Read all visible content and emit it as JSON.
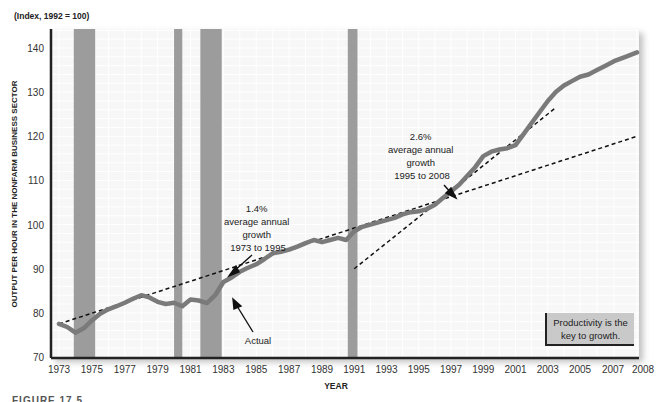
{
  "chart_data": {
    "type": "line",
    "title": "",
    "units_note": "(Index, 1992 = 100)",
    "xlabel": "YEAR",
    "ylabel": "OUTPUT PER HOUR IN THE NONFARM BUSINESS SECTOR",
    "ylim": [
      70,
      145
    ],
    "xlim": [
      1973,
      2008
    ],
    "y_ticks": [
      70,
      80,
      90,
      100,
      110,
      120,
      130,
      140
    ],
    "x_ticks": [
      "1973",
      "1975",
      "1977",
      "1979",
      "1981",
      "1983",
      "1985",
      "1987",
      "1989",
      "1991",
      "1993",
      "1995",
      "1997",
      "1999",
      "2001",
      "2003",
      "2005",
      "2007",
      "2008"
    ],
    "grid": true,
    "recession_shading": [
      [
        1973.9,
        1975.2
      ],
      [
        1980.0,
        1980.5
      ],
      [
        1981.6,
        1982.9
      ],
      [
        1990.6,
        1991.2
      ]
    ],
    "series": [
      {
        "name": "Actual",
        "style": "solid-thick-gray",
        "x": [
          1973,
          1973.5,
          1974,
          1974.5,
          1975,
          1975.5,
          1976,
          1976.5,
          1977,
          1977.5,
          1978,
          1978.5,
          1979,
          1979.5,
          1980,
          1980.5,
          1981,
          1981.5,
          1982,
          1982.5,
          1983,
          1983.5,
          1984,
          1984.5,
          1985,
          1985.5,
          1986,
          1986.5,
          1987,
          1987.5,
          1988,
          1988.5,
          1989,
          1989.5,
          1990,
          1990.5,
          1991,
          1991.5,
          1992,
          1992.5,
          1993,
          1993.5,
          1994,
          1994.5,
          1995,
          1995.5,
          1996,
          1996.5,
          1997,
          1997.5,
          1998,
          1998.5,
          1999,
          1999.5,
          2000,
          2000.5,
          2001,
          2001.5,
          2002,
          2002.5,
          2003,
          2003.5,
          2004,
          2004.5,
          2005,
          2005.5,
          2006,
          2006.5,
          2007,
          2007.5,
          2008
        ],
        "values": [
          77.5,
          76.8,
          75.5,
          76.5,
          78.3,
          79.8,
          80.8,
          81.5,
          82.3,
          83.2,
          84.0,
          83.5,
          82.5,
          82.0,
          82.3,
          81.5,
          83.0,
          82.8,
          82.2,
          84.0,
          87.0,
          88.0,
          89.3,
          90.2,
          91.0,
          92.2,
          93.5,
          93.8,
          94.3,
          95.0,
          95.8,
          96.5,
          96.0,
          96.5,
          97.0,
          96.5,
          98.5,
          99.5,
          100.0,
          100.5,
          101.0,
          101.5,
          102.3,
          102.8,
          103.0,
          103.5,
          104.5,
          106.0,
          107.5,
          109.0,
          111.0,
          113.0,
          115.5,
          116.5,
          117.0,
          117.3,
          118.0,
          120.5,
          123.0,
          125.5,
          128.0,
          130.0,
          131.5,
          132.5,
          133.5,
          134.0,
          135.0,
          136.0,
          137.0,
          138.0,
          139.0
        ]
      },
      {
        "name": "1.4% trend 1973 to 1995",
        "style": "dashed",
        "x": [
          1973,
          2008
        ],
        "values": [
          77.5,
          120.0
        ]
      },
      {
        "name": "2.6% trend 1995 to 2008",
        "style": "dashed",
        "x": [
          1991,
          2003.5
        ],
        "values": [
          90.0,
          126.5
        ]
      }
    ],
    "annotations": [
      {
        "text_lines": [
          "1.4%",
          "average annual",
          "growth",
          "1973 to 1995"
        ],
        "arrow_to": [
          1983.7,
          90.3
        ]
      },
      {
        "text_lines": [
          "2.6%",
          "average annual",
          "growth",
          "1995 to 2008"
        ],
        "arrow_to": [
          1996.6,
          108.0
        ]
      },
      {
        "text_lines": [
          "Actual"
        ],
        "arrow_to": [
          1983.4,
          86.8
        ]
      }
    ],
    "callout_box": [
      "Productivity is the",
      "key to growth."
    ]
  },
  "labels": {
    "units_note": "(Index, 1992 = 100)",
    "ylabel": "OUTPUT PER HOUR IN THE NONFARM BUSINESS SECTOR",
    "xlabel": "YEAR",
    "ann1": [
      "1.4%",
      "average annual",
      "growth",
      "1973 to 1995"
    ],
    "ann2": [
      "2.6%",
      "average annual",
      "growth",
      "1995 to 2008"
    ],
    "actual": "Actual",
    "callout_line1": "Productivity is the",
    "callout_line2": "key to growth."
  }
}
